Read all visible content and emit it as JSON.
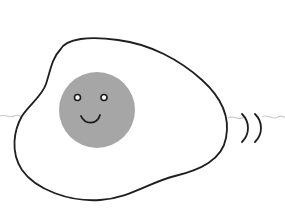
{
  "illustration": {
    "subject": "fried egg with smiling yolk",
    "colors": {
      "background": "#ffffff",
      "egg_white": "#ffffff",
      "outline": "#1e1e1e",
      "yolk": "#a6a6a6",
      "face": "#1a1a1a",
      "wavy_line": "#c8c8c8"
    },
    "elements": [
      "egg-white",
      "yolk",
      "left-eye",
      "right-eye",
      "smile",
      "motion-lines",
      "wavy-line"
    ]
  }
}
